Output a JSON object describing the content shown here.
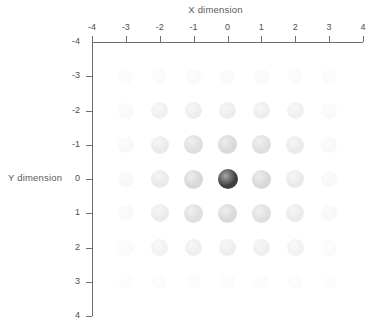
{
  "chart_data": {
    "type": "scatter",
    "title": "",
    "xlabel": "X dimension",
    "ylabel": "Y dimension",
    "xlim": [
      -4,
      4
    ],
    "ylim": [
      -4,
      4
    ],
    "y_axis_inverted": true,
    "grid": false,
    "legend": null,
    "x_ticks": [
      "-4",
      "-3",
      "-2",
      "-1",
      "0",
      "1",
      "2",
      "3",
      "4"
    ],
    "y_ticks": [
      "-4",
      "-3",
      "-2",
      "-1",
      "0",
      "1",
      "2",
      "3",
      "4"
    ],
    "x_tick_values": [
      -4,
      -3,
      -2,
      -1,
      0,
      1,
      2,
      3,
      4
    ],
    "y_tick_values": [
      -4,
      -3,
      -2,
      -1,
      0,
      1,
      2,
      3,
      4
    ],
    "marker": "sphere",
    "encoding": "color-intensity",
    "points": [
      {
        "x": -3,
        "y": -3,
        "value": 0.01,
        "color": "#fbfbfb",
        "size": 15
      },
      {
        "x": -2,
        "y": -3,
        "value": 0.013,
        "color": "#fafafa",
        "size": 15
      },
      {
        "x": -1,
        "y": -3,
        "value": 0.015,
        "color": "#f9f9f9",
        "size": 15
      },
      {
        "x": 0,
        "y": -3,
        "value": 0.016,
        "color": "#f9f9f9",
        "size": 15
      },
      {
        "x": 1,
        "y": -3,
        "value": 0.015,
        "color": "#f9f9f9",
        "size": 15
      },
      {
        "x": 2,
        "y": -3,
        "value": 0.013,
        "color": "#fafafa",
        "size": 15
      },
      {
        "x": 3,
        "y": -3,
        "value": 0.01,
        "color": "#fbfbfb",
        "size": 15
      },
      {
        "x": -3,
        "y": -2,
        "value": 0.015,
        "color": "#f9f9f9",
        "size": 16
      },
      {
        "x": -2,
        "y": -2,
        "value": 0.045,
        "color": "#f0f0f0",
        "size": 17
      },
      {
        "x": -1,
        "y": -2,
        "value": 0.06,
        "color": "#ededed",
        "size": 17
      },
      {
        "x": 0,
        "y": -2,
        "value": 0.065,
        "color": "#ececec",
        "size": 17
      },
      {
        "x": 1,
        "y": -2,
        "value": 0.06,
        "color": "#ededed",
        "size": 17
      },
      {
        "x": 2,
        "y": -2,
        "value": 0.045,
        "color": "#f0f0f0",
        "size": 17
      },
      {
        "x": 3,
        "y": -2,
        "value": 0.015,
        "color": "#f9f9f9",
        "size": 16
      },
      {
        "x": -3,
        "y": -1,
        "value": 0.018,
        "color": "#f8f8f8",
        "size": 16
      },
      {
        "x": -2,
        "y": -1,
        "value": 0.07,
        "color": "#eaeaea",
        "size": 18
      },
      {
        "x": -1,
        "y": -1,
        "value": 0.13,
        "color": "#dedede",
        "size": 19
      },
      {
        "x": 0,
        "y": -1,
        "value": 0.165,
        "color": "#d8d8d8",
        "size": 19
      },
      {
        "x": 1,
        "y": -1,
        "value": 0.13,
        "color": "#dedede",
        "size": 19
      },
      {
        "x": 2,
        "y": -1,
        "value": 0.07,
        "color": "#eaeaea",
        "size": 18
      },
      {
        "x": 3,
        "y": -1,
        "value": 0.018,
        "color": "#f8f8f8",
        "size": 16
      },
      {
        "x": -3,
        "y": 0,
        "value": 0.02,
        "color": "#f7f7f7",
        "size": 16
      },
      {
        "x": -2,
        "y": 0,
        "value": 0.075,
        "color": "#e9e9e9",
        "size": 18
      },
      {
        "x": -1,
        "y": 0,
        "value": 0.17,
        "color": "#d7d7d7",
        "size": 19
      },
      {
        "x": 0,
        "y": 0,
        "value": 1.0,
        "color": "#3c3c3c",
        "size": 20
      },
      {
        "x": 1,
        "y": 0,
        "value": 0.17,
        "color": "#d7d7d7",
        "size": 19
      },
      {
        "x": 2,
        "y": 0,
        "value": 0.075,
        "color": "#e9e9e9",
        "size": 18
      },
      {
        "x": 3,
        "y": 0,
        "value": 0.02,
        "color": "#f7f7f7",
        "size": 16
      },
      {
        "x": -3,
        "y": 1,
        "value": 0.018,
        "color": "#f8f8f8",
        "size": 16
      },
      {
        "x": -2,
        "y": 1,
        "value": 0.07,
        "color": "#eaeaea",
        "size": 18
      },
      {
        "x": -1,
        "y": 1,
        "value": 0.13,
        "color": "#dedede",
        "size": 19
      },
      {
        "x": 0,
        "y": 1,
        "value": 0.16,
        "color": "#d9d9d9",
        "size": 19
      },
      {
        "x": 1,
        "y": 1,
        "value": 0.13,
        "color": "#dedede",
        "size": 19
      },
      {
        "x": 2,
        "y": 1,
        "value": 0.07,
        "color": "#eaeaea",
        "size": 18
      },
      {
        "x": 3,
        "y": 1,
        "value": 0.018,
        "color": "#f8f8f8",
        "size": 16
      },
      {
        "x": -3,
        "y": 2,
        "value": 0.014,
        "color": "#fafafa",
        "size": 16
      },
      {
        "x": -2,
        "y": 2,
        "value": 0.04,
        "color": "#f1f1f1",
        "size": 17
      },
      {
        "x": -1,
        "y": 2,
        "value": 0.055,
        "color": "#eeeeee",
        "size": 17
      },
      {
        "x": 0,
        "y": 2,
        "value": 0.058,
        "color": "#ededed",
        "size": 17
      },
      {
        "x": 1,
        "y": 2,
        "value": 0.055,
        "color": "#eeeeee",
        "size": 17
      },
      {
        "x": 2,
        "y": 2,
        "value": 0.04,
        "color": "#f1f1f1",
        "size": 17
      },
      {
        "x": 3,
        "y": 2,
        "value": 0.014,
        "color": "#fafafa",
        "size": 16
      },
      {
        "x": -3,
        "y": 3,
        "value": 0.008,
        "color": "#fcfcfc",
        "size": 15
      },
      {
        "x": -2,
        "y": 3,
        "value": 0.01,
        "color": "#fbfbfb",
        "size": 15
      },
      {
        "x": -1,
        "y": 3,
        "value": 0.012,
        "color": "#fbfbfb",
        "size": 15
      },
      {
        "x": 0,
        "y": 3,
        "value": 0.012,
        "color": "#fbfbfb",
        "size": 15
      },
      {
        "x": 1,
        "y": 3,
        "value": 0.012,
        "color": "#fbfbfb",
        "size": 15
      },
      {
        "x": 2,
        "y": 3,
        "value": 0.01,
        "color": "#fbfbfb",
        "size": 15
      },
      {
        "x": 3,
        "y": 3,
        "value": 0.008,
        "color": "#fcfcfc",
        "size": 15
      }
    ]
  },
  "colors": {
    "axis": "#6e6e6e",
    "text": "#4d4d4d",
    "title": "#595959",
    "background": "#ffffff",
    "peak_marker": "#3c3c3c"
  }
}
